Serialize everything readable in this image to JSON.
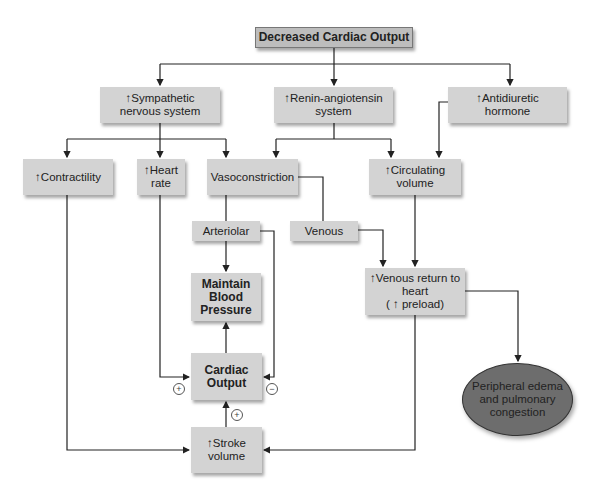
{
  "diagram": {
    "nodes": {
      "decreased_co": "Decreased Cardiac Output",
      "sympathetic": "↑Sympathetic\nnervous system",
      "renin": "↑Renin-angiotensin\nsystem",
      "adh": "↑Antidiuretic\nhormone",
      "contractility": "↑Contractility",
      "heart_rate": "↑Heart\nrate",
      "vasoconstriction": "Vasoconstriction",
      "circulating_volume": "↑Circulating\nvolume",
      "arteriolar": "Arteriolar",
      "venous": "Venous",
      "maintain_bp": "Maintain\nBlood\nPressure",
      "venous_return": "↑Venous return to\nheart\n( ↑ preload)",
      "cardiac_output": "Cardiac\nOutput",
      "stroke_volume": "↑Stroke\nvolume",
      "edema": "Peripheral edema\nand pulmonary\ncongestion"
    },
    "signs": {
      "hr_to_co": "+",
      "arteriolar_to_co": "−",
      "sv_to_co": "+"
    },
    "edges": [
      [
        "decreased_co",
        "sympathetic"
      ],
      [
        "decreased_co",
        "renin"
      ],
      [
        "decreased_co",
        "adh"
      ],
      [
        "sympathetic",
        "contractility"
      ],
      [
        "sympathetic",
        "heart_rate"
      ],
      [
        "sympathetic",
        "vasoconstriction"
      ],
      [
        "renin",
        "vasoconstriction"
      ],
      [
        "renin",
        "circulating_volume"
      ],
      [
        "adh",
        "circulating_volume"
      ],
      [
        "vasoconstriction",
        "arteriolar"
      ],
      [
        "vasoconstriction",
        "venous"
      ],
      [
        "arteriolar",
        "maintain_bp"
      ],
      [
        "arteriolar",
        "cardiac_output"
      ],
      [
        "venous",
        "venous_return"
      ],
      [
        "circulating_volume",
        "venous_return"
      ],
      [
        "cardiac_output",
        "maintain_bp"
      ],
      [
        "heart_rate",
        "cardiac_output"
      ],
      [
        "stroke_volume",
        "cardiac_output"
      ],
      [
        "contractility",
        "stroke_volume"
      ],
      [
        "venous_return",
        "stroke_volume"
      ],
      [
        "venous_return",
        "edema"
      ]
    ],
    "colors": {
      "box_fill": "#d3d3d3",
      "top_box_fill": "#bdbdbd",
      "ellipse_fill": "#6d6d6d",
      "line": "#222222"
    }
  }
}
